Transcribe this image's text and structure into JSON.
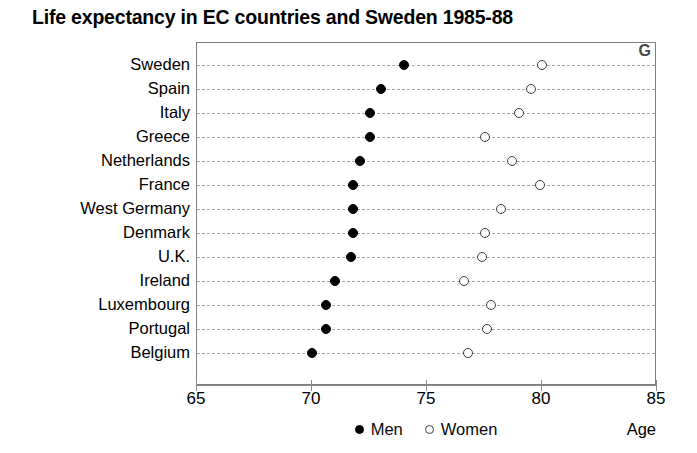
{
  "chart_data": {
    "type": "scatter",
    "title": "Life expectancy in EC countries and Sweden 1985-88",
    "xlabel": "Age",
    "ylabel": "",
    "xlim": [
      65,
      85
    ],
    "xticks": [
      65,
      70,
      75,
      80,
      85
    ],
    "xtick_labels": [
      "65",
      "70",
      "75",
      "80",
      "85"
    ],
    "grid": true,
    "legend_position": "bottom-center",
    "corner_letter": "G",
    "categories": [
      "Sweden",
      "Spain",
      "Italy",
      "Greece",
      "Netherlands",
      "France",
      "West Germany",
      "Denmark",
      "U.K.",
      "Ireland",
      "Luxembourg",
      "Portugal",
      "Belgium"
    ],
    "series": [
      {
        "name": "Men",
        "marker": "filled-circle",
        "color": "#000000",
        "values": [
          74.0,
          73.0,
          72.5,
          72.5,
          72.1,
          71.8,
          71.8,
          71.8,
          71.7,
          71.0,
          70.6,
          70.6,
          70.0
        ]
      },
      {
        "name": "Women",
        "marker": "open-circle",
        "color": "#ffffff",
        "values": [
          80.0,
          79.5,
          79.0,
          77.5,
          78.7,
          79.9,
          78.2,
          77.5,
          77.4,
          76.6,
          77.8,
          77.6,
          76.8
        ]
      }
    ]
  }
}
